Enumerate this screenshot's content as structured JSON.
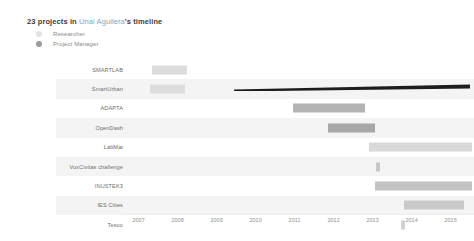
{
  "header": {
    "count_text": "23 projects in ",
    "person": "Unai Aguilera",
    "suffix": "'s timeline"
  },
  "legend": {
    "items": [
      {
        "label": "Researcher",
        "color": "#e2e2e2",
        "icon": "circle-icon"
      },
      {
        "label": "Project Manager",
        "color": "#9a9a9a",
        "icon": "circle-filled-icon"
      }
    ]
  },
  "chart_data": {
    "type": "bar",
    "title": "23 projects in Unai Aguilera's timeline",
    "xlabel": "",
    "ylabel": "",
    "orientation": "horizontal",
    "grid": false,
    "legend_position": "top-left",
    "xlim": [
      2006.6,
      2015.6
    ],
    "categories": [
      "SMARTLAB",
      "SmartUrban",
      "ADAPTA",
      "OpenDash",
      "LabMat",
      "VoxCivitas challenge",
      "INUSTEK3",
      "IES Cities",
      "Tesoo"
    ],
    "tick_labels": [
      "2007",
      "2008",
      "2009",
      "2010",
      "2011",
      "2012",
      "2013",
      "2014",
      "2015"
    ],
    "tick_values": [
      2007,
      2008,
      2009,
      2010,
      2011,
      2012,
      2013,
      2014,
      2015
    ],
    "bars": [
      {
        "label": "SMARTLAB",
        "start": 2007.35,
        "end": 2008.25,
        "role": "Researcher",
        "color": "#dcdcdc"
      },
      {
        "label": "SmartUrban",
        "start": 2007.28,
        "end": 2008.18,
        "role": "Researcher",
        "color": "#dedede"
      },
      {
        "label": "ADAPTA",
        "start": 2010.95,
        "end": 2012.8,
        "role": "Project Manager",
        "color": "#b4b4b4"
      },
      {
        "label": "OpenDash",
        "start": 2011.85,
        "end": 2013.05,
        "role": "Project Manager",
        "color": "#a8a8a8"
      },
      {
        "label": "LabMat",
        "start": 2012.9,
        "end": 2015.55,
        "role": "Researcher",
        "color": "#d8d8d8"
      },
      {
        "label": "VoxCivitas challenge",
        "start": 2013.08,
        "end": 2013.18,
        "role": "Researcher",
        "color": "#c8c8c8"
      },
      {
        "label": "INUSTEK3",
        "start": 2013.05,
        "end": 2015.55,
        "role": "Researcher",
        "color": "#c4c4c4"
      },
      {
        "label": "IES Cities",
        "start": 2013.8,
        "end": 2015.35,
        "role": "Researcher",
        "color": "#c9c9c9"
      },
      {
        "label": "Tesoo",
        "start": 2013.72,
        "end": 2013.82,
        "role": "Researcher",
        "color": "#d0d0d0"
      }
    ],
    "rows": [
      {
        "label": "SMARTLAB"
      },
      {
        "label": "SmartUrban"
      },
      {
        "label": "ADAPTA"
      },
      {
        "label": "OpenDash"
      },
      {
        "label": "LabMat"
      },
      {
        "label": "VoxCivitas challenge"
      },
      {
        "label": "INUSTEK3"
      },
      {
        "label": "IES Cities"
      },
      {
        "label": "Tesoo"
      }
    ],
    "overlay": {
      "name": "selection-wedge",
      "color": "#1d1d1d",
      "start": 2009.45,
      "end": 2015.5
    }
  },
  "colors": {
    "band_light": "#ffffff",
    "band_shade": "#f4f4f4",
    "text_muted": "#8f8f8f",
    "link": "#7ea6c4"
  }
}
